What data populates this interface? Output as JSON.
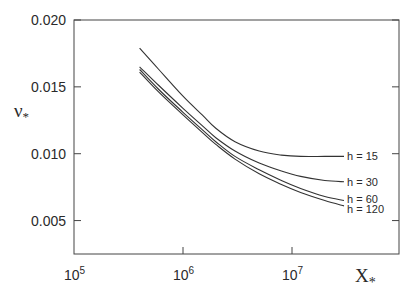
{
  "chart_data": {
    "type": "line",
    "title": "",
    "xlabel": "X*",
    "ylabel": "ν*",
    "xscale": "log",
    "xlim": [
      100000,
      60000000
    ],
    "ylim": [
      0.0025,
      0.02
    ],
    "grid": false,
    "legend": "inline labels at right end of each curve",
    "x_ticks": [
      {
        "value": 100000,
        "base": "10",
        "exp": "5"
      },
      {
        "value": 1000000,
        "base": "10",
        "exp": "6"
      },
      {
        "value": 10000000,
        "base": "10",
        "exp": "7"
      }
    ],
    "y_ticks": [
      {
        "value": 0.02,
        "label": "0.020"
      },
      {
        "value": 0.015,
        "label": "0.015"
      },
      {
        "value": 0.01,
        "label": "0.010"
      },
      {
        "value": 0.005,
        "label": "0.005"
      }
    ],
    "x": [
      400000,
      600000,
      1000000,
      1500000,
      2000000,
      3000000,
      5000000,
      8000000,
      12000000,
      20000000,
      30000000
    ],
    "series": [
      {
        "name": "h = 15",
        "label": "h = 15",
        "values": [
          0.0179,
          0.0163,
          0.0143,
          0.0129,
          0.0119,
          0.0109,
          0.0102,
          0.0099,
          0.0098,
          0.0098,
          0.0098
        ]
      },
      {
        "name": "h = 30",
        "label": "h = 30",
        "values": [
          0.0165,
          0.0151,
          0.0134,
          0.0121,
          0.0112,
          0.0102,
          0.0093,
          0.0087,
          0.0083,
          0.008,
          0.0079
        ]
      },
      {
        "name": "h = 60",
        "label": "h = 60",
        "values": [
          0.0163,
          0.0148,
          0.0131,
          0.0118,
          0.0109,
          0.0098,
          0.0088,
          0.008,
          0.0074,
          0.0068,
          0.0065
        ]
      },
      {
        "name": "h = 120",
        "label": "h = 120",
        "values": [
          0.0161,
          0.0146,
          0.0129,
          0.0116,
          0.0107,
          0.0096,
          0.0085,
          0.0077,
          0.0071,
          0.0065,
          0.0061
        ]
      }
    ]
  },
  "axes": {
    "x_title_base": "X",
    "x_title_sub": "*",
    "y_title_base": "ν",
    "y_title_sub": "*"
  },
  "colors": {
    "line": "#333333",
    "axis": "#444444",
    "text": "#2a2a2a"
  }
}
